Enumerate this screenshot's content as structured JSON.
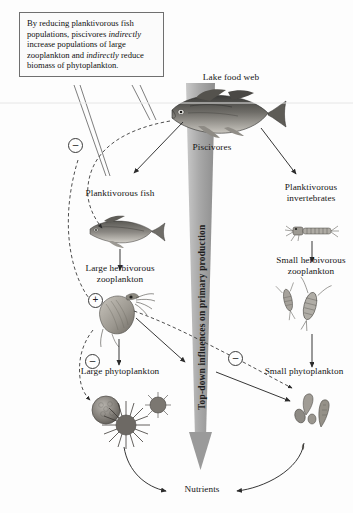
{
  "figure": {
    "title": "Lake food web",
    "vertical_arrow_label": "Top-down influences on primary production",
    "callout": {
      "line1": "By reducing planktivorous fish",
      "line2a": "populations, piscivores ",
      "line2b": "indirectly",
      "line3": "increase populations of large",
      "line4a": "zooplankton and ",
      "line4b": "indirectly",
      "line4c": " reduce",
      "line5": "biomass of phytoplankton."
    },
    "nodes": {
      "piscivores": "Piscivores",
      "planktivorous_fish": "Planktivorous fish",
      "large_herbivorous_zooplankton": "Large herbivorous\nzooplankton",
      "large_phytoplankton": "Large phytoplankton",
      "planktivorous_invertebrates": "Planktivorous\ninvertebrates",
      "small_herbivorous_zooplankton": "Small herbivorous\nzooplankton",
      "small_phytoplankton": "Small phytoplankton",
      "nutrients": "Nutrients"
    },
    "signs": {
      "minus_top": "–",
      "plus_mid": "+",
      "minus_left": "–",
      "minus_right": "–"
    },
    "colors": {
      "arrow_gray": "#9a9a9a",
      "line_dark": "#2b2b2b",
      "box_border": "#6f6f6f",
      "text": "#141414"
    }
  }
}
